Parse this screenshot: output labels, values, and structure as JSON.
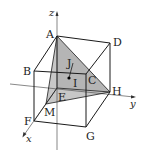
{
  "figure": {
    "type": "3d-cube-with-coordinate-axes",
    "colors": {
      "edge": "#1a1a1a",
      "axis": "#555555",
      "shade": "#b5b5b5"
    },
    "axes": {
      "x": "x",
      "y": "y",
      "z": "z"
    },
    "vertices": {
      "A": "A",
      "B": "B",
      "C": "C",
      "D": "D",
      "E": "E",
      "F": "F",
      "G": "G",
      "H": "H",
      "M": "M",
      "I": "I",
      "J": "J"
    },
    "shaded_faces": [
      "AMH",
      "AEH"
    ]
  }
}
